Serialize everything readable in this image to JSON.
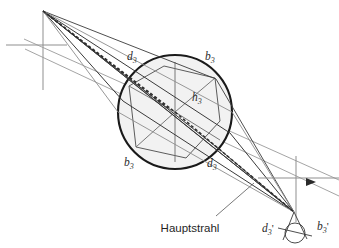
{
  "diagram": {
    "colors": {
      "background": "#ffffff",
      "lens_outline": "#1a1a1a",
      "lens_fill": "#f2f2f2",
      "ray_dark": "#3a3a3a",
      "ray_light": "#8c8c8c",
      "axis_gray": "#8f8f8f",
      "dashed_ray": "#2f2f2f",
      "text": "#222222"
    },
    "labels": [
      {
        "id": "d3-upper",
        "text": "d",
        "sub": "3",
        "prime": "",
        "x": 127,
        "y": 60,
        "name": "label-d3-upper"
      },
      {
        "id": "b3-upper",
        "text": "b",
        "sub": "3",
        "prime": "",
        "x": 205,
        "y": 60,
        "name": "label-b3-upper"
      },
      {
        "id": "h3",
        "text": "h",
        "sub": "3",
        "prime": "",
        "x": 192,
        "y": 101,
        "name": "label-h3"
      },
      {
        "id": "b3-lower",
        "text": "b",
        "sub": "3",
        "prime": "",
        "x": 124,
        "y": 166,
        "name": "label-b3-lower"
      },
      {
        "id": "d3-lower",
        "text": "d",
        "sub": "3",
        "prime": "",
        "x": 207,
        "y": 167,
        "name": "label-d3-lower"
      },
      {
        "id": "d3-prime",
        "text": "d",
        "sub": "3",
        "prime": "'",
        "x": 262,
        "y": 232,
        "name": "label-d3-prime"
      },
      {
        "id": "b3-prime",
        "text": "b",
        "sub": "3",
        "prime": "'",
        "x": 317,
        "y": 230,
        "name": "label-b3-prime"
      }
    ],
    "annotation": {
      "text": "Hauptstrahl",
      "x": 190,
      "y": 232,
      "name": "annotation-hauptstrahl"
    },
    "geometry": {
      "object_point": {
        "x": 43,
        "y": 11
      },
      "image_point": {
        "x": 294,
        "y": 212
      },
      "lens": {
        "cx": 175,
        "cy": 112,
        "r": 57
      },
      "image_blur_circle": {
        "cx": 295,
        "cy": 233,
        "r": 10
      },
      "left_axis": {
        "x": 43,
        "y_top": 11,
        "y_bottom": 90,
        "hx_left": 6,
        "hx_right": 67,
        "hy": 45
      },
      "right_axis": {
        "x": 296,
        "y_top": 156,
        "y_bottom": 222,
        "hx_left": 258,
        "hx_right": 339,
        "hy": 178
      },
      "arrow_marker": {
        "x": 311,
        "y": 182
      },
      "leader_line": {
        "x1": 216,
        "y1": 216,
        "x2": 254,
        "y2": 183
      }
    }
  }
}
